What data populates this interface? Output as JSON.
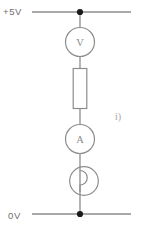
{
  "figure": {
    "part_label": "i)",
    "line_color": "#8d8d8d",
    "node_color": "#1a1a1a",
    "text_color": "#6e6e6e",
    "background": "#ffffff"
  },
  "rails": {
    "top": {
      "label": "+5V",
      "name": "supply-rail",
      "y": 12,
      "x_start": 32,
      "x_end": 131
    },
    "bottom": {
      "label": "0V",
      "name": "ground-rail",
      "y": 214,
      "x_start": 32,
      "x_end": 131
    }
  },
  "nodes": [
    {
      "name": "top-node",
      "x": 80,
      "y": 12,
      "radius": 3.1
    },
    {
      "name": "bottom-node",
      "x": 80,
      "y": 214,
      "radius": 3.1
    }
  ],
  "components": [
    {
      "id": "voltmeter",
      "type": "meter",
      "symbol": "V",
      "label": "Voltmeter",
      "cx": 80,
      "cy": 42,
      "r": 14.5
    },
    {
      "id": "resistor",
      "type": "resistor",
      "symbol": "",
      "label": "Resistor",
      "x": 73,
      "y": 68,
      "width": 14,
      "height": 41
    },
    {
      "id": "ammeter",
      "type": "meter",
      "symbol": "A",
      "label": "Ammeter",
      "cx": 80,
      "cy": 139,
      "r": 14.5
    },
    {
      "id": "lamp",
      "type": "lamp",
      "symbol": "",
      "label": "Lamp",
      "cx": 84,
      "cy": 181,
      "r": 14.5
    }
  ],
  "wires": [
    {
      "name": "wire-top-to-voltmeter",
      "x1": 80,
      "y1": 12,
      "x2": 80,
      "y2": 27.5
    },
    {
      "name": "wire-voltmeter-to-resistor",
      "x1": 80,
      "y1": 56.5,
      "x2": 80,
      "y2": 68
    },
    {
      "name": "wire-resistor-to-ammeter",
      "x1": 80,
      "y1": 109,
      "x2": 80,
      "y2": 124.5
    },
    {
      "name": "wire-ammeter-to-lamp",
      "x1": 80,
      "y1": 153.5,
      "x2": 80,
      "y2": 214
    }
  ]
}
